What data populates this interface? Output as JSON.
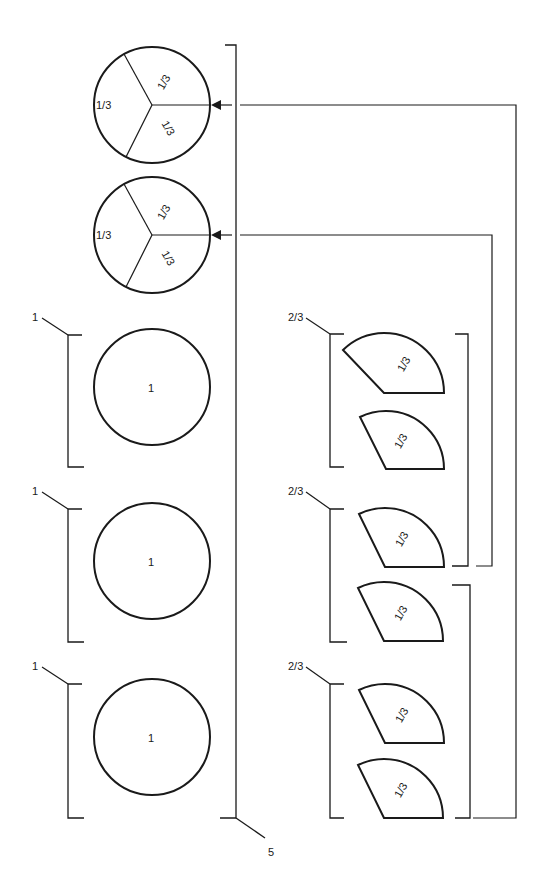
{
  "diagram": {
    "stroke_color": "#1a1a1a",
    "background": "#ffffff",
    "total_label": "5",
    "thirds_circles": [
      {
        "id": "thirds-circle-1",
        "slices": [
          "1/3",
          "1/3",
          "1/3"
        ]
      },
      {
        "id": "thirds-circle-2",
        "slices": [
          "1/3",
          "1/3",
          "1/3"
        ]
      }
    ],
    "whole_groups": [
      {
        "label": "1",
        "circle_label": "1"
      },
      {
        "label": "1",
        "circle_label": "1"
      },
      {
        "label": "1",
        "circle_label": "1"
      }
    ],
    "two_thirds_groups": [
      {
        "label": "2/3",
        "pieces": [
          "1/3",
          "1/3"
        ]
      },
      {
        "label": "2/3",
        "pieces": [
          "1/3",
          "1/3"
        ]
      },
      {
        "label": "2/3",
        "pieces": [
          "1/3",
          "1/3"
        ]
      }
    ]
  }
}
